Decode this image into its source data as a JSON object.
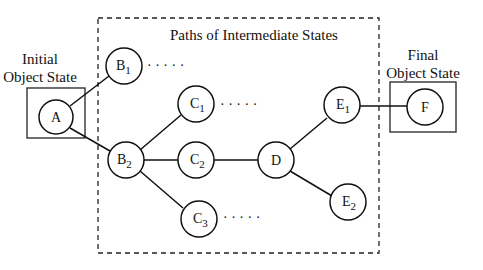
{
  "labels": {
    "initial_line1": "Initial",
    "initial_line2": "Object State",
    "final_line1": "Final",
    "final_line2": "Object State",
    "paths": "Paths of Intermediate States"
  },
  "nodes": {
    "A": {
      "letter": "A",
      "sub": ""
    },
    "B1": {
      "letter": "B",
      "sub": "1"
    },
    "B2": {
      "letter": "B",
      "sub": "2"
    },
    "C1": {
      "letter": "C",
      "sub": "1"
    },
    "C2": {
      "letter": "C",
      "sub": "2"
    },
    "C3": {
      "letter": "C",
      "sub": "3"
    },
    "D": {
      "letter": "D",
      "sub": ""
    },
    "E1": {
      "letter": "E",
      "sub": "1"
    },
    "E2": {
      "letter": "E",
      "sub": "2"
    },
    "F": {
      "letter": "F",
      "sub": ""
    }
  },
  "ellipsis": "· · · · ·",
  "edges": [
    [
      "A",
      "B1"
    ],
    [
      "A",
      "B2"
    ],
    [
      "B2",
      "C1"
    ],
    [
      "B2",
      "C2"
    ],
    [
      "B2",
      "C3"
    ],
    [
      "C2",
      "D"
    ],
    [
      "D",
      "E1"
    ],
    [
      "D",
      "E2"
    ],
    [
      "E1",
      "F"
    ]
  ]
}
